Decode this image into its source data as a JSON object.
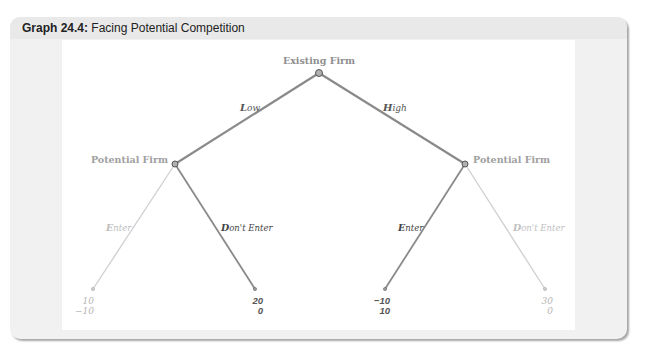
{
  "figure": {
    "title_bold": "Graph 24.4:",
    "title_rest": " Facing Potential Competition"
  },
  "tree": {
    "root": {
      "label": "Existing Firm"
    },
    "left_node": {
      "label": "Potential Firm"
    },
    "right_node": {
      "label": "Potential Firm"
    },
    "branches": {
      "low": {
        "initial": "L",
        "rest": "ow"
      },
      "high": {
        "initial": "H",
        "rest": "igh"
      },
      "left_enter": {
        "initial": "E",
        "rest": "nter"
      },
      "left_dont_enter": {
        "initial": "D",
        "rest": "on't Enter"
      },
      "right_enter": {
        "initial": "E",
        "rest": "nter"
      },
      "right_dont_enter": {
        "initial": "D",
        "rest": "on't Enter"
      }
    },
    "payoffs": [
      {
        "top": "10",
        "bottom": "−10",
        "highlighted": false
      },
      {
        "top": "20",
        "bottom": "0",
        "highlighted": true
      },
      {
        "top": "−10",
        "bottom": "10",
        "highlighted": true
      },
      {
        "top": "30",
        "bottom": "0",
        "highlighted": false
      }
    ]
  },
  "colors": {
    "active_line": "#8a8a8a",
    "faded_line": "#c8c8c8",
    "label_gray": "#999999",
    "active_text": "#555555",
    "faded_text": "#b5b5b5",
    "node_fill": "#b0b0b0",
    "node_stroke": "#555555"
  }
}
